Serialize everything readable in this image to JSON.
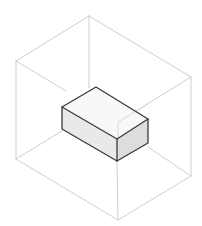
{
  "diagram": {
    "title": "",
    "colors": {
      "background": "#ffffff",
      "cube_edge": "#c9c9c9",
      "box_edge": "#3a3a3a",
      "box_top": "#f8f8f8",
      "box_left": "#e9e9e9",
      "box_right": "#dddddd"
    },
    "outer_cube": {
      "vertices": {
        "top": [
          89,
          16
        ],
        "left_top": [
          16,
          61
        ],
        "right_top": [
          191,
          77
        ],
        "front_top": [
          118,
          122
        ],
        "left_bottom": [
          16,
          159
        ],
        "right_bottom": [
          191,
          176
        ],
        "bottom": [
          118,
          220
        ],
        "back_bottom": [
          89,
          115
        ]
      }
    },
    "inner_box": {
      "vertices": {
        "top_back": [
          96,
          87
        ],
        "top_left": [
          62,
          107
        ],
        "top_right": [
          148,
          119
        ],
        "top_front": [
          117,
          139
        ],
        "bottom_left": [
          62,
          129
        ],
        "bottom_front": [
          117,
          161
        ],
        "bottom_right": [
          148,
          143
        ]
      }
    }
  }
}
